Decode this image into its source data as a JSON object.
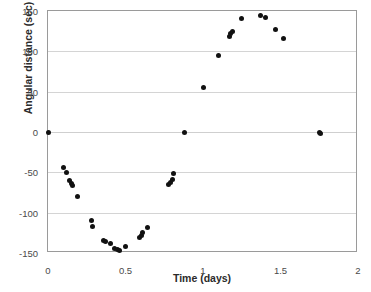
{
  "chart_data": {
    "type": "scatter",
    "title": "",
    "xlabel": "Time (days)",
    "ylabel": "Angular distance (sec)",
    "xlim": [
      0,
      2
    ],
    "ylim": [
      -150,
      150
    ],
    "xticks": [
      0,
      0.5,
      1,
      1.5,
      2
    ],
    "xtick_labels": [
      "0",
      "0.5",
      "1",
      "1.5",
      "2"
    ],
    "yticks": [
      -150,
      -100,
      -50,
      0,
      50,
      100,
      150
    ],
    "ytick_labels": [
      "-150",
      "-100",
      "-50",
      "0",
      "50",
      "100",
      "150"
    ],
    "grid": "horizontal",
    "legend": "none",
    "marker": "filled-circle",
    "marker_color": "#111111",
    "series": [
      {
        "name": "Angular distance",
        "points": [
          [
            0.0,
            0
          ],
          [
            0.1,
            -44
          ],
          [
            0.12,
            -50
          ],
          [
            0.14,
            -60
          ],
          [
            0.15,
            -64
          ],
          [
            0.16,
            -66
          ],
          [
            0.19,
            -80
          ],
          [
            0.28,
            -110
          ],
          [
            0.29,
            -117
          ],
          [
            0.36,
            -135
          ],
          [
            0.37,
            -136
          ],
          [
            0.4,
            -138
          ],
          [
            0.43,
            -144
          ],
          [
            0.45,
            -146
          ],
          [
            0.46,
            -147
          ],
          [
            0.5,
            -142
          ],
          [
            0.59,
            -131
          ],
          [
            0.6,
            -128
          ],
          [
            0.61,
            -125
          ],
          [
            0.64,
            -118
          ],
          [
            0.78,
            -65
          ],
          [
            0.79,
            -62
          ],
          [
            0.8,
            -59
          ],
          [
            0.81,
            -51
          ],
          [
            0.88,
            -1
          ],
          [
            1.0,
            55
          ],
          [
            1.1,
            95
          ],
          [
            1.17,
            119
          ],
          [
            1.18,
            122
          ],
          [
            1.19,
            124
          ],
          [
            1.25,
            141
          ],
          [
            1.37,
            145
          ],
          [
            1.4,
            142
          ],
          [
            1.47,
            127
          ],
          [
            1.52,
            116
          ],
          [
            1.75,
            -1
          ],
          [
            1.76,
            -2
          ]
        ]
      }
    ]
  },
  "axes": {
    "frame_color": "#9a9a9a",
    "grid_color": "#d4d4d4"
  }
}
